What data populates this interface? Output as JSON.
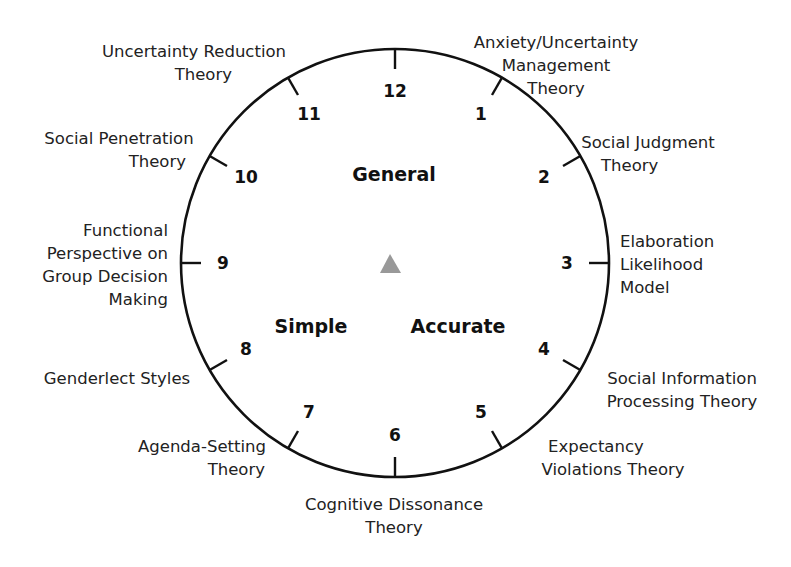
{
  "diagram": {
    "type": "clock-wheel",
    "center_marker": "triangle",
    "marker_color": "#999999",
    "line_color": "#111111",
    "zones": [
      {
        "id": "general",
        "label": "General"
      },
      {
        "id": "simple",
        "label": "Simple"
      },
      {
        "id": "accurate",
        "label": "Accurate"
      }
    ],
    "positions": [
      {
        "number": "12",
        "theory": []
      },
      {
        "number": "1",
        "theory": [
          "Anxiety/Uncertainty",
          "Management",
          "Theory"
        ]
      },
      {
        "number": "2",
        "theory": [
          "Social Judgment",
          "Theory"
        ]
      },
      {
        "number": "3",
        "theory": [
          "Elaboration",
          "Likelihood",
          "Model"
        ]
      },
      {
        "number": "4",
        "theory": [
          "Social Information",
          "Processing Theory"
        ]
      },
      {
        "number": "5",
        "theory": [
          "Expectancy",
          "Violations Theory"
        ]
      },
      {
        "number": "6",
        "theory": [
          "Cognitive Dissonance",
          "Theory"
        ]
      },
      {
        "number": "7",
        "theory": [
          "Agenda-Setting",
          "Theory"
        ]
      },
      {
        "number": "8",
        "theory": [
          "Genderlect Styles"
        ]
      },
      {
        "number": "9",
        "theory": [
          "Functional",
          "Perspective on",
          "Group Decision",
          "Making"
        ]
      },
      {
        "number": "10",
        "theory": [
          "Social Penetration",
          "Theory"
        ]
      },
      {
        "number": "11",
        "theory": [
          "Uncertainty Reduction",
          "Theory"
        ]
      }
    ]
  }
}
